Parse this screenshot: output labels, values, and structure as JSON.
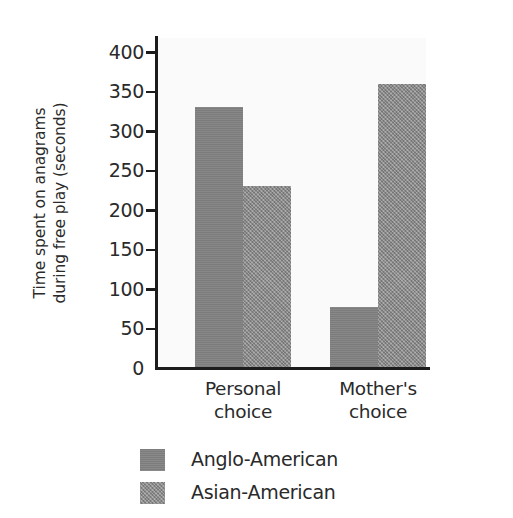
{
  "chart_data": {
    "type": "bar",
    "title": "",
    "subtitle": "",
    "xlabel": "",
    "ylabel": "Time spent on anagrams during free play (seconds)",
    "ylabel_line1": "Time spent on anagrams",
    "ylabel_line2": "during free play (seconds)",
    "categories": [
      "Personal choice",
      "Mother's choice"
    ],
    "category_lines": [
      {
        "line1": "Personal",
        "line2": "choice"
      },
      {
        "line1": "Mother's",
        "line2": "choice"
      }
    ],
    "series": [
      {
        "name": "Anglo-American",
        "values": [
          330,
          77
        ],
        "color": "#818181"
      },
      {
        "name": "Asian-American",
        "values": [
          230,
          360
        ],
        "color": "#8d8d8d"
      }
    ],
    "ylim": [
      0,
      400
    ],
    "ytick_values": [
      400,
      350,
      300,
      250,
      200,
      150,
      100,
      50,
      0
    ],
    "ytick_labels": [
      "400",
      "350",
      "300",
      "250",
      "200",
      "150",
      "100",
      "50",
      "0"
    ],
    "ytick_interval": 50,
    "grid": false,
    "legend_position": "bottom-center",
    "plot_background": "#fafafa",
    "axis_color": "#1c1c1c",
    "text_color": "#2a2a2a"
  },
  "legend": {
    "entries": [
      {
        "label": "Anglo-American",
        "swatch": "anglo"
      },
      {
        "label": "Asian-American",
        "swatch": "asian"
      }
    ]
  }
}
